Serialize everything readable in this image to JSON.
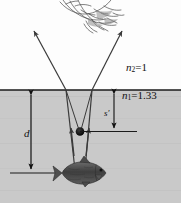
{
  "figure": {
    "colors": {
      "air": "#fdfdfd",
      "water": "#c9c9c9",
      "ray": "#3a3a3a",
      "surface_line": "#1a1a1a",
      "image_dot": "#000000",
      "fish_body": "#4a4a4a",
      "text": "#111111"
    },
    "labels": {
      "n2": {
        "symbol": "n",
        "subscript": "2",
        "equals": "=",
        "value": "1",
        "full": "n2 = 1"
      },
      "n1": {
        "symbol": "n",
        "subscript": "1",
        "equals": "=",
        "value": "1.33",
        "full": "n1 = 1.33"
      },
      "depth": {
        "symbol": "d",
        "full": "d"
      },
      "image_distance": {
        "symbol": "s",
        "prime": "′",
        "full": "s′"
      }
    },
    "regions": [
      {
        "name": "air",
        "label_ref": "n2",
        "index": "1"
      },
      {
        "name": "water",
        "label_ref": "n1",
        "index": "1.33"
      }
    ],
    "objects": [
      {
        "name": "observer",
        "description": "sketched face of person looking down at water"
      },
      {
        "name": "fish",
        "description": "fish at depth d below the surface"
      },
      {
        "name": "virtual-image",
        "description": "black dot marking apparent position of fish at depth s-prime"
      }
    ],
    "rays": [
      {
        "name": "left-refracted-ray",
        "direction": "up-left",
        "arrow": true
      },
      {
        "name": "right-refracted-ray",
        "direction": "up-right",
        "arrow": true
      },
      {
        "name": "left-incident-ray",
        "direction": "up",
        "arrow": true
      },
      {
        "name": "right-incident-ray",
        "direction": "up",
        "arrow": true
      },
      {
        "name": "left-virtual-extension",
        "direction": "down-to-image",
        "arrow": false
      },
      {
        "name": "right-virtual-extension",
        "direction": "down-to-image",
        "arrow": false
      }
    ],
    "dimension_arrows": [
      {
        "name": "depth-arrow",
        "label_ref": "depth",
        "orientation": "vertical",
        "double_headed": true
      },
      {
        "name": "image-distance-arrow",
        "label_ref": "image_distance",
        "orientation": "vertical",
        "double_headed": true
      }
    ]
  }
}
